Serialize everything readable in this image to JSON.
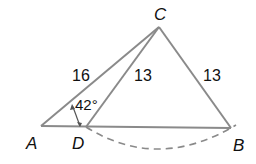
{
  "diagram": {
    "type": "geometry-triangle",
    "points": {
      "A": {
        "label": "A"
      },
      "B": {
        "label": "B"
      },
      "C": {
        "label": "C"
      },
      "D": {
        "label": "D"
      }
    },
    "segments": {
      "AC": {
        "length_label": "16"
      },
      "DC": {
        "length_label": "13"
      },
      "BC": {
        "length_label": "13"
      }
    },
    "angle": {
      "at": "A",
      "label": "42°"
    },
    "arc": {
      "from": "D",
      "to": "B",
      "style": "dashed",
      "center": "C"
    },
    "colors": {
      "line": "#8a8a8a",
      "text": "#111111",
      "dashed": "#8a8a8a"
    }
  }
}
